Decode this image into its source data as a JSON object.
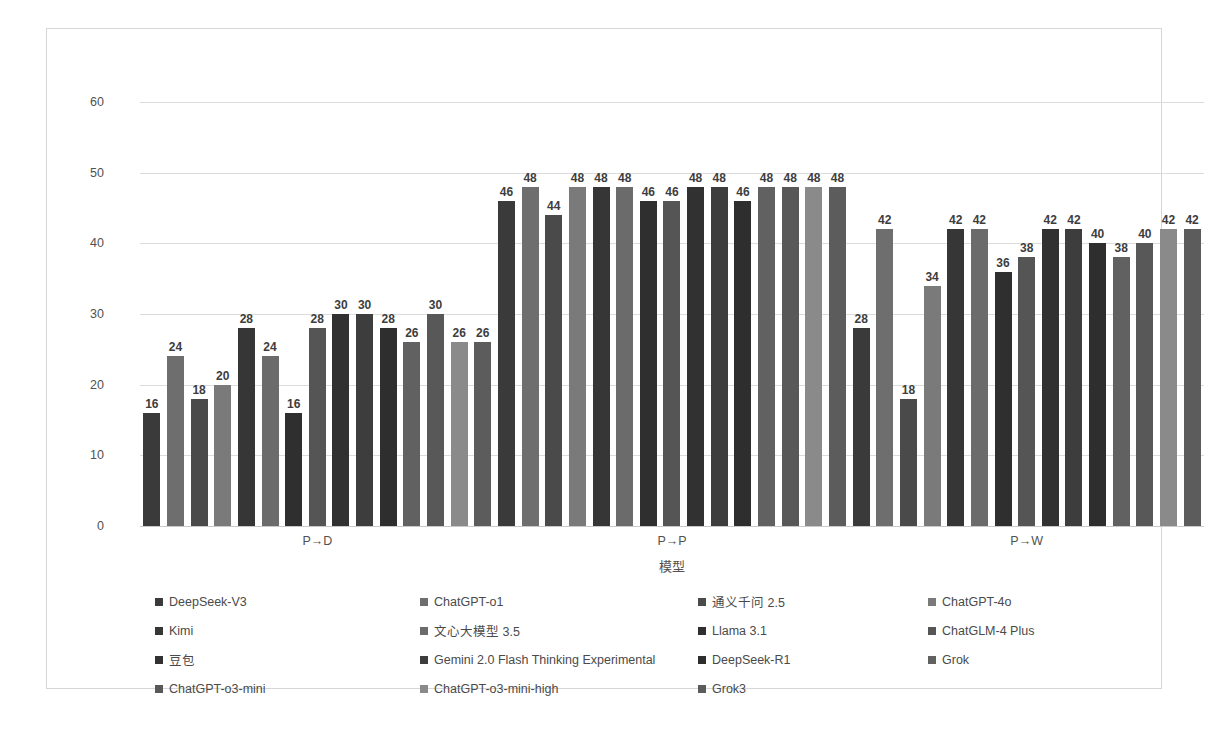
{
  "chart_data": {
    "type": "bar",
    "title": "",
    "xlabel": "模型",
    "ylabel": "",
    "ylim": [
      0,
      60
    ],
    "yticks": [
      0,
      10,
      20,
      30,
      40,
      50,
      60
    ],
    "grid": true,
    "legend_position": "bottom",
    "categories": [
      "P→D",
      "P→P",
      "P→W"
    ],
    "series": [
      {
        "name": "DeepSeek-V3",
        "color": "#3a3a3a",
        "values": [
          16,
          46,
          28
        ]
      },
      {
        "name": "ChatGPT-o1",
        "color": "#6e6e6e",
        "values": [
          24,
          48,
          42
        ]
      },
      {
        "name": "通义千问 2.5",
        "color": "#4a4a4a",
        "values": [
          18,
          44,
          18
        ]
      },
      {
        "name": "ChatGPT-4o",
        "color": "#7a7a7a",
        "values": [
          20,
          48,
          34
        ]
      },
      {
        "name": "Kimi",
        "color": "#363636",
        "values": [
          28,
          48,
          42
        ]
      },
      {
        "name": "文心大模型 3.5",
        "color": "#6b6b6b",
        "values": [
          24,
          48,
          42
        ]
      },
      {
        "name": "Llama 3.1",
        "color": "#2f2f2f",
        "values": [
          16,
          46,
          36
        ]
      },
      {
        "name": "ChatGLM-4 Plus",
        "color": "#555555",
        "values": [
          28,
          46,
          38
        ]
      },
      {
        "name": "豆包",
        "color": "#313131",
        "values": [
          30,
          48,
          42
        ]
      },
      {
        "name": "Gemini 2.0 Flash Thinking Experimental",
        "color": "#3d3d3d",
        "values": [
          30,
          48,
          42
        ]
      },
      {
        "name": "DeepSeek-R1",
        "color": "#2e2e2e",
        "values": [
          28,
          46,
          40
        ]
      },
      {
        "name": "Grok",
        "color": "#616161",
        "values": [
          26,
          48,
          38
        ]
      },
      {
        "name": "ChatGPT-o3-mini",
        "color": "#585858",
        "values": [
          30,
          48,
          40
        ]
      },
      {
        "name": "ChatGPT-o3-mini-high",
        "color": "#8a8a8a",
        "values": [
          26,
          48,
          42
        ]
      },
      {
        "name": "Grok3",
        "color": "#5c5c5c",
        "values": [
          26,
          48,
          42
        ]
      }
    ]
  },
  "axis": {
    "y_tick_labels": [
      "0",
      "10",
      "20",
      "30",
      "40",
      "50",
      "60"
    ],
    "x_tick_labels": [
      "P→D",
      "P→P",
      "P→W"
    ],
    "x_axis_title": "模型"
  },
  "legend": {
    "entries": [
      "DeepSeek-V3",
      "ChatGPT-o1",
      "通义千问 2.5",
      "ChatGPT-4o",
      "Kimi",
      "文心大模型 3.5",
      "Llama 3.1",
      "ChatGLM-4 Plus",
      "豆包",
      "Gemini 2.0 Flash Thinking Experimental",
      "DeepSeek-R1",
      "Grok",
      "ChatGPT-o3-mini",
      "ChatGPT-o3-mini-high",
      "Grok3"
    ]
  },
  "colors": {
    "bar_dark": "#3a3a3a",
    "bar_mid": "#6e6e6e",
    "bar_light": "#8a8a8a",
    "gridline": "#dcdcdc",
    "frame": "#d6d6d6",
    "text": "#515151"
  }
}
